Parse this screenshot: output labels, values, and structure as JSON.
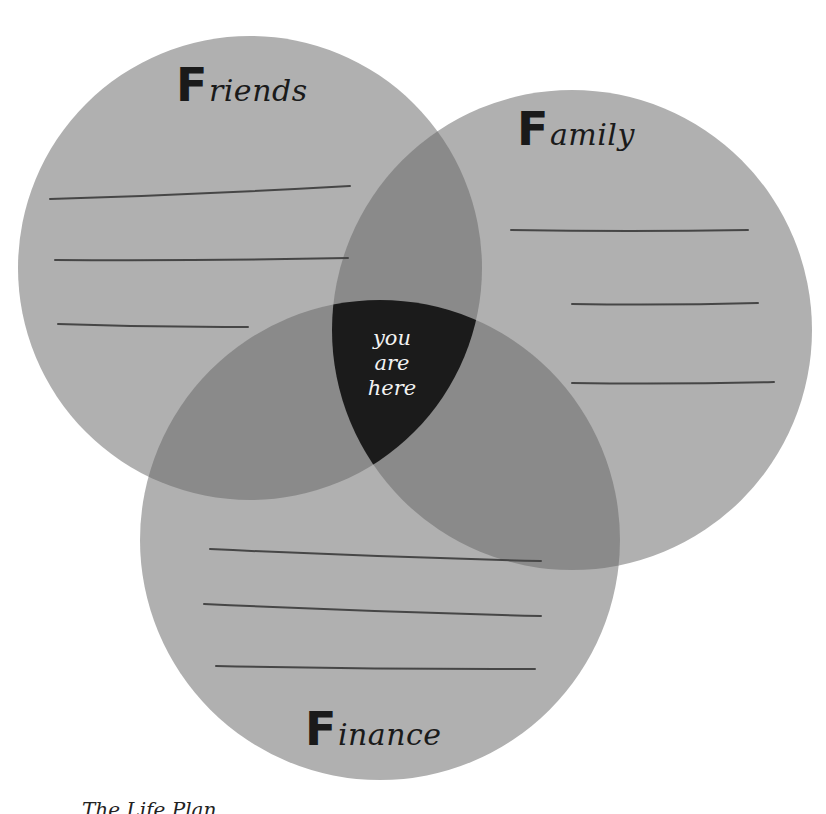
{
  "diagram": {
    "type": "venn",
    "colors": {
      "circle_fill": "#b0b0b0",
      "double_overlap": "#8a8a8a",
      "triple_overlap": "#1b1b1b",
      "line": "#464646",
      "label": "#1a1a1a",
      "center_text": "#f2f2f2"
    },
    "circles": [
      {
        "id": "friends",
        "label_initial": "F",
        "label_rest": "riends",
        "cx": 250,
        "cy": 268,
        "r": 232,
        "lines": [
          {
            "x1": 50,
            "y1": 199,
            "x2": 350,
            "y2": 186
          },
          {
            "x1": 55,
            "y1": 260,
            "x2": 348,
            "y2": 258
          },
          {
            "x1": 58,
            "y1": 324,
            "x2": 248,
            "y2": 327
          }
        ]
      },
      {
        "id": "family",
        "label_initial": "F",
        "label_rest": "amily",
        "cx": 572,
        "cy": 330,
        "r": 240,
        "lines": [
          {
            "x1": 511,
            "y1": 230,
            "x2": 748,
            "y2": 230
          },
          {
            "x1": 572,
            "y1": 304,
            "x2": 758,
            "y2": 303
          },
          {
            "x1": 572,
            "y1": 383,
            "x2": 774,
            "y2": 382
          }
        ]
      },
      {
        "id": "finance",
        "label_initial": "F",
        "label_rest": "inance",
        "cx": 380,
        "cy": 540,
        "r": 240,
        "lines": [
          {
            "x1": 210,
            "y1": 549,
            "x2": 541,
            "y2": 561
          },
          {
            "x1": 204,
            "y1": 604,
            "x2": 541,
            "y2": 616
          },
          {
            "x1": 216,
            "y1": 666,
            "x2": 535,
            "y2": 669
          }
        ]
      }
    ],
    "center_label": [
      "you",
      "are",
      "here"
    ],
    "footer_text": "The Life Plan"
  }
}
